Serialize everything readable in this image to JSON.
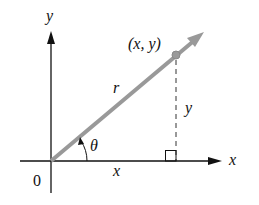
{
  "diagram": {
    "axes": {
      "x_axis_label": "x",
      "y_axis_label": "y",
      "origin_label": "0"
    },
    "point": {
      "label": "(x, y)"
    },
    "segments": {
      "radius_label": "r",
      "horizontal_label": "x",
      "vertical_label": "y",
      "angle_label": "θ"
    },
    "colors": {
      "axis": "#111111",
      "radius_vector": "#999999",
      "point": "#999999",
      "dashed_line": "#333333",
      "text": "#111111"
    }
  }
}
